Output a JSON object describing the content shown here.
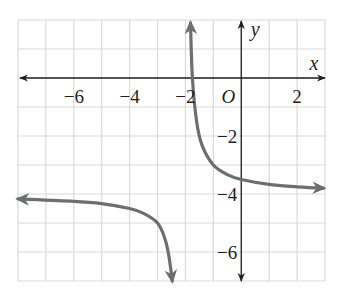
{
  "chart_data": {
    "type": "line",
    "title": "",
    "function": "y = 1/(x+2) - 4",
    "xlabel": "x",
    "ylabel": "y",
    "origin_label": "O",
    "xlim": [
      -8,
      3
    ],
    "ylim": [
      -7,
      2
    ],
    "grid": true,
    "grid_step": 1,
    "x_ticks": [
      {
        "value": -6,
        "label": "−6"
      },
      {
        "value": -4,
        "label": "−4"
      },
      {
        "value": -2,
        "label": "−2"
      },
      {
        "value": 2,
        "label": "2"
      }
    ],
    "y_ticks": [
      {
        "value": -2,
        "label": "−2"
      },
      {
        "value": -4,
        "label": "−4"
      },
      {
        "value": -6,
        "label": "−6"
      }
    ],
    "asymptotes": {
      "vertical": -2,
      "horizontal": -4
    },
    "series": [
      {
        "name": "right-branch",
        "x": [
          -1.82,
          -1.75,
          -1.6,
          -1.4,
          -1.0,
          -0.5,
          0,
          1,
          2,
          2.95
        ],
        "y": [
          1.9,
          0,
          -1.5,
          -2.33,
          -3.0,
          -3.33,
          -3.5,
          -3.67,
          -3.75,
          -3.8
        ]
      },
      {
        "name": "left-branch",
        "x": [
          -8,
          -6,
          -5,
          -4,
          -3.5,
          -3,
          -2.75,
          -2.6,
          -2.47
        ],
        "y": [
          -4.17,
          -4.25,
          -4.33,
          -4.5,
          -4.67,
          -5.0,
          -5.5,
          -6.1,
          -7.0
        ]
      }
    ]
  },
  "colors": {
    "grid": "#d9d9d9",
    "axis": "#231f20",
    "curve": "#6d6e71"
  }
}
